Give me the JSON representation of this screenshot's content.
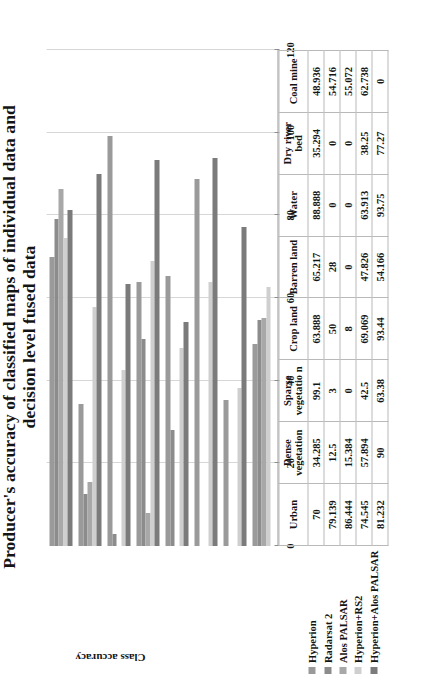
{
  "title": {
    "line1": "Producer's accuracy of classified maps of individual data and",
    "line2": "decision level fused data"
  },
  "axis": {
    "ylabel": "Class accuracy",
    "ticks": [
      "0",
      "20",
      "40",
      "60",
      "80",
      "100",
      "120"
    ]
  },
  "legend": {
    "items": [
      {
        "label": "Hyperion",
        "color": "#9a9a9a"
      },
      {
        "label": "Radarsat 2",
        "color": "#8c8c8c"
      },
      {
        "label": "Alos PALSAR",
        "color": "#a8a8a8"
      },
      {
        "label": "Hyperion+RS2",
        "color": "#cfcfcf"
      },
      {
        "label": "Hyperion+Alos PALSAR",
        "color": "#7b7b7b"
      }
    ]
  },
  "chart_data": {
    "type": "bar",
    "title": "Producer's accuracy of classified maps of individual data and decision level fused data",
    "xlabel": "",
    "ylabel": "Class accuracy",
    "ylim": [
      0,
      120
    ],
    "yticks": [
      0,
      20,
      40,
      60,
      80,
      100,
      120
    ],
    "grid": true,
    "legend_position": "bottom",
    "orientation": "vertical-rotated",
    "categories": [
      "Urban",
      "Dense vegetation",
      "Sparse vegetation",
      "Crop land",
      "Barren land",
      "Water",
      "Dry river bed",
      "Coal mine"
    ],
    "series": [
      {
        "name": "Hyperion",
        "color": "#9a9a9a",
        "values": [
          70,
          34.285,
          99.1,
          63.888,
          65.217,
          88.888,
          35.294,
          48.936
        ]
      },
      {
        "name": "Radarsat 2",
        "color": "#8c8c8c",
        "values": [
          79.139,
          12.5,
          3,
          50,
          28,
          0,
          0,
          54.716
        ]
      },
      {
        "name": "Alos PALSAR",
        "color": "#a8a8a8",
        "values": [
          86.444,
          15.384,
          0,
          8,
          0,
          0,
          0,
          55.072
        ]
      },
      {
        "name": "Hyperion+RS2",
        "color": "#cfcfcf",
        "values": [
          74.545,
          57.894,
          42.5,
          69.069,
          47.826,
          63.913,
          38.25,
          62.738
        ]
      },
      {
        "name": "Hyperion+Alos PALSAR",
        "color": "#7b7b7b",
        "values": [
          81.232,
          90,
          63.38,
          93.44,
          54.166,
          93.75,
          77.27,
          0
        ]
      }
    ]
  },
  "table": {
    "headers": [
      "Urban",
      "Dense vegetation",
      "Sparse vegetatio n",
      "Crop land",
      "Barren land",
      "Water",
      "Dry river bed",
      "Coal mine"
    ],
    "rows": [
      {
        "label": "Hyperion",
        "values": [
          "70",
          "34.285",
          "99.1",
          "63.888",
          "65.217",
          "88.888",
          "35.294",
          "48.936"
        ]
      },
      {
        "label": "Radarsat 2",
        "values": [
          "79.139",
          "12.5",
          "3",
          "50",
          "28",
          "0",
          "0",
          "54.716"
        ]
      },
      {
        "label": "Alos PALSAR",
        "values": [
          "86.444",
          "15.384",
          "0",
          "8",
          "0",
          "0",
          "0",
          "55.072"
        ]
      },
      {
        "label": "Hyperion+RS2",
        "values": [
          "74.545",
          "57.894",
          "42.5",
          "69.069",
          "47.826",
          "63.913",
          "38.25",
          "62.738"
        ]
      },
      {
        "label": "Hyperion+Alos PALSAR",
        "values": [
          "81.232",
          "90",
          "63.38",
          "93.44",
          "54.166",
          "93.75",
          "77.27",
          "0"
        ]
      }
    ]
  }
}
